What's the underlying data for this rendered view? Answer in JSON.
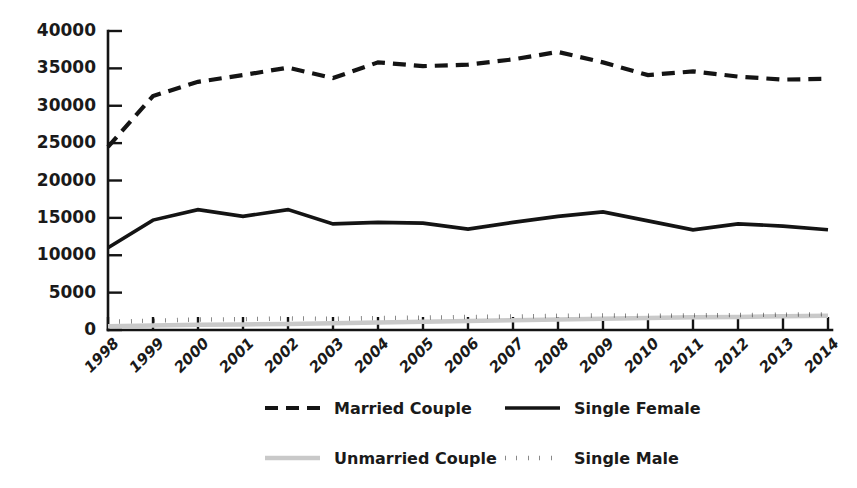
{
  "chart_data": {
    "type": "line",
    "title": "",
    "subtitle": "",
    "xlabel": "",
    "ylabel": "",
    "grid": false,
    "legend_position": "bottom",
    "xlim": [
      1998,
      2014
    ],
    "ylim": [
      0,
      40000
    ],
    "ytick_values": [
      0,
      5000,
      10000,
      15000,
      20000,
      25000,
      30000,
      35000,
      40000
    ],
    "ytick_labels": [
      "0",
      "5000",
      "10000",
      "15000",
      "20000",
      "25000",
      "30000",
      "35000",
      "40000"
    ],
    "categories": [
      1998,
      1999,
      2000,
      2001,
      2002,
      2003,
      2004,
      2005,
      2006,
      2007,
      2008,
      2009,
      2010,
      2011,
      2012,
      2013,
      2014
    ],
    "xtick_labels": [
      "1998",
      "1999",
      "2000",
      "2001",
      "2002",
      "2003",
      "2004",
      "2005",
      "2006",
      "2007",
      "2008",
      "2009",
      "2010",
      "2011",
      "2012",
      "2013",
      "2014"
    ],
    "series": [
      {
        "name": "Married Couple",
        "style": "dashed",
        "color": "#141414",
        "values": [
          24500,
          31300,
          33200,
          34100,
          35100,
          33700,
          35800,
          35300,
          35500,
          36200,
          37200,
          35800,
          34100,
          34600,
          33900,
          33500,
          33600
        ]
      },
      {
        "name": "Single Female",
        "style": "solid",
        "color": "#141414",
        "values": [
          11000,
          14700,
          16100,
          15200,
          16100,
          14200,
          14400,
          14300,
          13500,
          14400,
          15200,
          15800,
          14600,
          13400,
          14200,
          13900,
          13400
        ]
      },
      {
        "name": "Unmarried Couple",
        "style": "light-solid",
        "color": "#c9c9c9",
        "values": [
          500,
          600,
          700,
          750,
          800,
          900,
          1000,
          1100,
          1200,
          1300,
          1400,
          1500,
          1600,
          1700,
          1750,
          1850,
          1900
        ]
      },
      {
        "name": "Single Male",
        "style": "dotted",
        "color": "#141414",
        "values": [
          1100,
          1250,
          1400,
          1450,
          1550,
          1500,
          1600,
          1650,
          1750,
          1800,
          1900,
          1950,
          1900,
          1950,
          2000,
          2050,
          2100
        ]
      }
    ],
    "legend": [
      {
        "label": "Married Couple",
        "style": "dashed",
        "color": "#141414"
      },
      {
        "label": "Single Female",
        "style": "solid",
        "color": "#141414"
      },
      {
        "label": "Unmarried Couple",
        "style": "light-solid",
        "color": "#c9c9c9"
      },
      {
        "label": "Single Male",
        "style": "dotted",
        "color": "#141414"
      }
    ]
  }
}
